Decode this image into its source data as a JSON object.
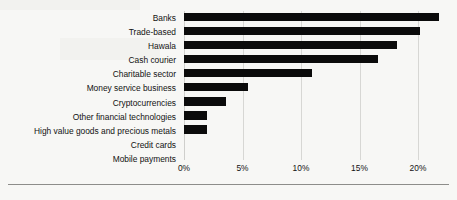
{
  "chart_data": {
    "type": "bar",
    "orientation": "horizontal",
    "title": "",
    "subtitle": "",
    "xlabel": "",
    "ylabel": "",
    "xlim": [
      0,
      20
    ],
    "grid": true,
    "legend": null,
    "xtick_labels": [
      "0%",
      "5%",
      "10%",
      "15%",
      "20%"
    ],
    "xtick_values": [
      0,
      5,
      10,
      15,
      20
    ],
    "categories": [
      "Banks",
      "Trade-based",
      "Hawala",
      "Cash courier",
      "Charitable sector",
      "Money service business",
      "Cryptocurrencies",
      "Other financial technologies",
      "High value goods and precious metals",
      "Credit cards",
      "Mobile payments"
    ],
    "values": [
      21.8,
      20.2,
      18.2,
      16.6,
      10.9,
      5.5,
      3.6,
      2.0,
      2.0,
      0,
      0
    ],
    "bar_color": "#0b0b0b",
    "gridline_color": "#d7d7d4",
    "background_color": "#f7f7f5"
  }
}
